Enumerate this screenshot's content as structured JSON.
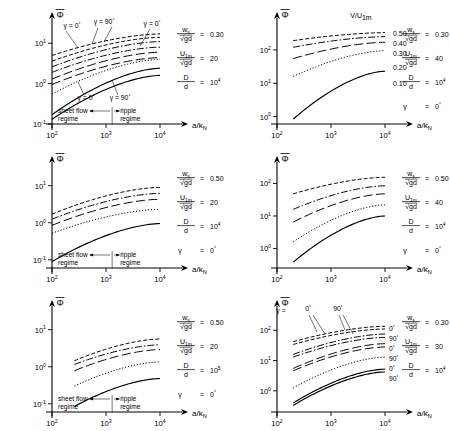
{
  "figure": {
    "axis_labels": {
      "x": "a/k",
      "x_sub": "N",
      "y": "Φ"
    },
    "x_ticks": [
      {
        "mant": "10",
        "exp": "2"
      },
      {
        "mant": "10",
        "exp": "3"
      },
      {
        "mant": "10",
        "exp": "4"
      }
    ],
    "regime": {
      "left_line1": "sheet flow",
      "left_line2": "regime",
      "right_line1": "ripple",
      "right_line2": "regime"
    },
    "symbols": {
      "ws": "w",
      "ws_sub": "s",
      "sqrt_gd": "√gd",
      "u1m": "U",
      "u1m_sub": "1m",
      "D": "D",
      "d": "d",
      "gamma": "γ",
      "equals": "=",
      "ratio_V_U": "V/U",
      "ratio_V_U_sub": "1m"
    }
  },
  "chart_data": [
    {
      "id": "panel-1",
      "type": "line",
      "title": "",
      "xlabel": "a/kN",
      "ylabel": "Φ",
      "xscale": "log",
      "yscale": "log",
      "xlim": [
        100,
        10000
      ],
      "ylim": [
        0.1,
        30
      ],
      "y_ticks": [
        {
          "mant": "10",
          "exp": "1"
        },
        {
          "mant": "10",
          "exp": "0"
        },
        {
          "mant": "10",
          "exp": "-1"
        }
      ],
      "grid": false,
      "params": [
        {
          "num": "ws",
          "den": "sqrt_gd",
          "value": "0.30"
        },
        {
          "num": "u1m",
          "den": "sqrt_gd",
          "value": "20"
        },
        {
          "num": "D",
          "den": "d",
          "value": "10",
          "exp": "4"
        }
      ],
      "annotations": [
        {
          "text": "γ = 0",
          "sup": "°",
          "x": 72,
          "y": 28
        },
        {
          "text": "γ = 90",
          "sup": "°",
          "x": 104,
          "y": 24
        },
        {
          "text": "γ = 0",
          "sup": "°",
          "x": 152,
          "y": 26
        },
        {
          "text": "γ = 0",
          "sup": "°",
          "x": 86,
          "y": 100
        },
        {
          "text": "γ = 90",
          "sup": "°",
          "x": 120,
          "y": 100
        }
      ],
      "regime_shown": true,
      "series": [
        {
          "name": "0.50",
          "style": "dashed",
          "x": [
            100,
            10000
          ],
          "y": [
            5.0,
            17.0
          ]
        },
        {
          "name": "0.50b",
          "style": "dashed",
          "x": [
            100,
            10000
          ],
          "y": [
            3.6,
            14.0
          ]
        },
        {
          "name": "0.40",
          "style": "dashdot",
          "x": [
            100,
            10000
          ],
          "y": [
            2.6,
            11.0
          ]
        },
        {
          "name": "0.40b",
          "style": "dashdot",
          "x": [
            100,
            10000
          ],
          "y": [
            1.9,
            8.0
          ]
        },
        {
          "name": "0.30",
          "style": "longdash",
          "x": [
            100,
            10000
          ],
          "y": [
            1.3,
            6.0
          ]
        },
        {
          "name": "0.30b",
          "style": "longdash",
          "x": [
            100,
            10000
          ],
          "y": [
            0.95,
            4.4
          ]
        },
        {
          "name": "0.20",
          "style": "dotted",
          "x": [
            100,
            10000
          ],
          "y": [
            0.55,
            4.0
          ]
        },
        {
          "name": "0.10",
          "style": "solid",
          "x": [
            100,
            10000
          ],
          "y": [
            0.17,
            2.4
          ]
        },
        {
          "name": "0.10b",
          "style": "solid",
          "x": [
            100,
            10000
          ],
          "y": [
            0.13,
            1.6
          ]
        }
      ]
    },
    {
      "id": "panel-2",
      "type": "line",
      "xlabel": "a/kN",
      "ylabel": "Φ",
      "xscale": "log",
      "yscale": "log",
      "xlim": [
        100,
        10000
      ],
      "ylim": [
        0.6,
        600
      ],
      "y_ticks": [
        {
          "mant": "10",
          "exp": "2"
        },
        {
          "mant": "10",
          "exp": "1"
        },
        {
          "mant": "10",
          "exp": "0"
        }
      ],
      "grid": false,
      "legend_title": "V/U1m",
      "legend_position": "right",
      "params": [
        {
          "num": "ws",
          "den": "sqrt_gd",
          "value": "0.30"
        },
        {
          "num": "u1m",
          "den": "sqrt_gd",
          "value": "40"
        },
        {
          "num": "D",
          "den": "d",
          "value": "10",
          "exp": "4"
        },
        {
          "num": "gamma",
          "den": "",
          "value": "0",
          "exp_deg": "°"
        }
      ],
      "regime_shown": false,
      "series": [
        {
          "name": "0.50",
          "style": "dashed",
          "x": [
            200,
            10000
          ],
          "y": [
            190,
            330
          ]
        },
        {
          "name": "0.40",
          "style": "dashdot",
          "x": [
            200,
            10000
          ],
          "y": [
            120,
            250
          ]
        },
        {
          "name": "0.30",
          "style": "longdash",
          "x": [
            200,
            10000
          ],
          "y": [
            55,
            170
          ]
        },
        {
          "name": "0.20",
          "style": "dotted",
          "x": [
            200,
            10000
          ],
          "y": [
            16,
            95
          ]
        },
        {
          "name": "0.10",
          "style": "solid",
          "x": [
            200,
            10000
          ],
          "y": [
            0.85,
            23
          ]
        }
      ]
    },
    {
      "id": "panel-3",
      "type": "line",
      "xlabel": "a/kN",
      "ylabel": "Φ",
      "xscale": "log",
      "yscale": "log",
      "xlim": [
        100,
        10000
      ],
      "ylim": [
        0.06,
        30
      ],
      "y_ticks": [
        {
          "mant": "10",
          "exp": "1"
        },
        {
          "mant": "10",
          "exp": "0"
        },
        {
          "mant": "10",
          "exp": "-1"
        }
      ],
      "grid": false,
      "params": [
        {
          "num": "ws",
          "den": "sqrt_gd",
          "value": "0.50"
        },
        {
          "num": "u1m",
          "den": "sqrt_gd",
          "value": "20"
        },
        {
          "num": "D",
          "den": "d",
          "value": "10",
          "exp": "4"
        },
        {
          "num": "gamma",
          "den": "",
          "value": "0",
          "exp_deg": "°"
        }
      ],
      "regime_shown": true,
      "series": [
        {
          "name": "0.50",
          "style": "dashed",
          "x": [
            100,
            10000
          ],
          "y": [
            1.7,
            9.0
          ]
        },
        {
          "name": "0.40",
          "style": "dashdot",
          "x": [
            100,
            10000
          ],
          "y": [
            1.25,
            6.2
          ]
        },
        {
          "name": "0.30",
          "style": "longdash",
          "x": [
            100,
            10000
          ],
          "y": [
            0.85,
            4.3
          ]
        },
        {
          "name": "0.20",
          "style": "dotted",
          "x": [
            100,
            10000
          ],
          "y": [
            0.52,
            2.3
          ]
        },
        {
          "name": "0.10",
          "style": "solid",
          "x": [
            100,
            10000
          ],
          "y": [
            0.09,
            0.95
          ]
        }
      ]
    },
    {
      "id": "panel-4",
      "type": "line",
      "xlabel": "a/kN",
      "ylabel": "Φ",
      "xscale": "log",
      "yscale": "log",
      "xlim": [
        100,
        10000
      ],
      "ylim": [
        0.25,
        300
      ],
      "y_ticks": [
        {
          "mant": "10",
          "exp": "2"
        },
        {
          "mant": "10",
          "exp": "1"
        },
        {
          "mant": "10",
          "exp": "0"
        }
      ],
      "grid": false,
      "params": [
        {
          "num": "ws",
          "den": "sqrt_gd",
          "value": "0.50"
        },
        {
          "num": "u1m",
          "den": "sqrt_gd",
          "value": "40"
        },
        {
          "num": "D",
          "den": "d",
          "value": "10",
          "exp": "4"
        },
        {
          "num": "gamma",
          "den": "",
          "value": "0",
          "exp_deg": "°"
        }
      ],
      "regime_shown": false,
      "series": [
        {
          "name": "0.50",
          "style": "dashed",
          "x": [
            200,
            10000
          ],
          "y": [
            48,
            155
          ]
        },
        {
          "name": "0.40",
          "style": "dashdot",
          "x": [
            200,
            10000
          ],
          "y": [
            16,
            85
          ]
        },
        {
          "name": "0.30",
          "style": "longdash",
          "x": [
            200,
            10000
          ],
          "y": [
            6.5,
            48
          ]
        },
        {
          "name": "0.20",
          "style": "dotted",
          "x": [
            200,
            10000
          ],
          "y": [
            1.6,
            22
          ]
        },
        {
          "name": "0.10",
          "style": "solid",
          "x": [
            200,
            10000
          ],
          "y": [
            0.38,
            10
          ]
        }
      ]
    },
    {
      "id": "panel-5",
      "type": "line",
      "xlabel": "a/kN",
      "ylabel": "Φ",
      "xscale": "log",
      "yscale": "log",
      "xlim": [
        100,
        10000
      ],
      "ylim": [
        0.06,
        30
      ],
      "y_ticks": [
        {
          "mant": "10",
          "exp": "1"
        },
        {
          "mant": "10",
          "exp": "0"
        },
        {
          "mant": "10",
          "exp": "-1"
        }
      ],
      "grid": false,
      "params": [
        {
          "num": "ws",
          "den": "sqrt_gd",
          "value": "0.50"
        },
        {
          "num": "u1m",
          "den": "sqrt_gd",
          "value": "20"
        },
        {
          "num": "D",
          "den": "d",
          "value": "10",
          "exp": "5"
        },
        {
          "num": "gamma",
          "den": "",
          "value": "0",
          "exp_deg": "°"
        }
      ],
      "regime_shown": true,
      "series": [
        {
          "name": "0.50",
          "style": "dashed",
          "x": [
            260,
            10000
          ],
          "y": [
            1.45,
            5.6
          ]
        },
        {
          "name": "0.40",
          "style": "dashdot",
          "x": [
            260,
            10000
          ],
          "y": [
            1.15,
            3.9
          ]
        },
        {
          "name": "0.30",
          "style": "longdash",
          "x": [
            260,
            10000
          ],
          "y": [
            0.78,
            2.9
          ]
        },
        {
          "name": "0.20",
          "style": "dotted",
          "x": [
            260,
            10000
          ],
          "y": [
            0.3,
            1.35
          ]
        },
        {
          "name": "0.10",
          "style": "solid",
          "x": [
            260,
            10000
          ],
          "y": [
            0.085,
            0.48
          ]
        }
      ]
    },
    {
      "id": "panel-6",
      "type": "line",
      "xlabel": "a/kN",
      "ylabel": "Φ",
      "xscale": "log",
      "yscale": "log",
      "xlim": [
        100,
        10000
      ],
      "ylim": [
        0.2,
        400
      ],
      "y_ticks": [
        {
          "mant": "10",
          "exp": "2"
        },
        {
          "mant": "10",
          "exp": "1"
        },
        {
          "mant": "10",
          "exp": "0"
        }
      ],
      "grid": false,
      "params": [
        {
          "num": "ws",
          "den": "sqrt_gd",
          "value": "0.30"
        },
        {
          "num": "u1m",
          "den": "sqrt_gd",
          "value": "30"
        },
        {
          "num": "D",
          "den": "d",
          "value": "10",
          "exp": "4"
        }
      ],
      "top_annotations": [
        {
          "text": "γ =",
          "x": 56,
          "y": 25
        },
        {
          "text": "0",
          "sup": "°",
          "x": 83,
          "y": 23
        },
        {
          "text": "90",
          "sup": "°",
          "x": 113,
          "y": 23
        }
      ],
      "right_labels": [
        {
          "text": "0",
          "sup": "°"
        },
        {
          "text": "90",
          "sup": "°"
        },
        {
          "text": "0",
          "sup": "°"
        },
        {
          "text": "90",
          "sup": "°"
        },
        {
          "text": "0",
          "sup": "°"
        },
        {
          "text": "90",
          "sup": "°"
        }
      ],
      "regime_shown": false,
      "series": [
        {
          "name": "0.50-0",
          "style": "dashed",
          "x": [
            200,
            10000
          ],
          "y": [
            42,
            135
          ]
        },
        {
          "name": "0.50-90",
          "style": "dashed",
          "x": [
            200,
            10000
          ],
          "y": [
            34,
            110
          ]
        },
        {
          "name": "0.40-0",
          "style": "dashdot",
          "x": [
            200,
            10000
          ],
          "y": [
            16,
            75
          ]
        },
        {
          "name": "0.40-90",
          "style": "dashdot",
          "x": [
            200,
            10000
          ],
          "y": [
            13,
            58
          ]
        },
        {
          "name": "0.30-0",
          "style": "longdash",
          "x": [
            200,
            10000
          ],
          "y": [
            5.5,
            36
          ]
        },
        {
          "name": "0.30-90",
          "style": "longdash",
          "x": [
            200,
            10000
          ],
          "y": [
            4.6,
            28
          ]
        },
        {
          "name": "0.20-0",
          "style": "dotted",
          "x": [
            200,
            10000
          ],
          "y": [
            1.25,
            13
          ]
        },
        {
          "name": "0.10-0",
          "style": "solid",
          "x": [
            200,
            10000
          ],
          "y": [
            0.4,
            5.2
          ]
        },
        {
          "name": "0.10-90",
          "style": "solid",
          "x": [
            200,
            10000
          ],
          "y": [
            0.33,
            4.2
          ]
        }
      ]
    }
  ]
}
